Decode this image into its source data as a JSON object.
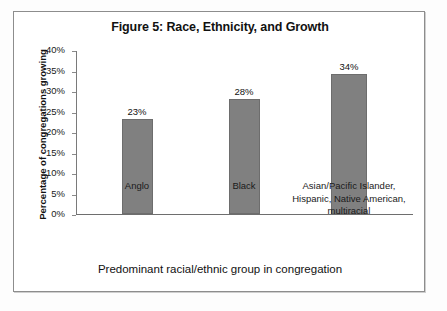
{
  "chart_data": {
    "type": "bar",
    "title": "Figure 5: Race, Ethnicity, and Growth",
    "xlabel": "Predominant racial/ethnic group in congregation",
    "ylabel": "Percentage of congregations growing",
    "categories": [
      "Anglo",
      "Black",
      "Asian/Pacific Islander,\nHispanic, Native American,\nmultiracial"
    ],
    "category_lines": [
      [
        "Anglo"
      ],
      [
        "Black"
      ],
      [
        "Asian/Pacific Islander,",
        "Hispanic, Native American,",
        "multiracial"
      ]
    ],
    "values": [
      23,
      28,
      34
    ],
    "value_labels": [
      "23%",
      "28%",
      "34%"
    ],
    "ylim": [
      0,
      40
    ],
    "ytick_values": [
      40,
      35,
      30,
      25,
      20,
      15,
      10,
      5,
      0
    ],
    "ytick_labels": [
      "40%",
      "35%",
      "30%",
      "25%",
      "20%",
      "15%",
      "10%",
      "5%",
      "0%"
    ],
    "grid": false,
    "legend": null,
    "bar_color": "#808080",
    "axis_color": "#7a7a7a",
    "frame_color": "#8d8d8d",
    "background": "#ffffff"
  }
}
